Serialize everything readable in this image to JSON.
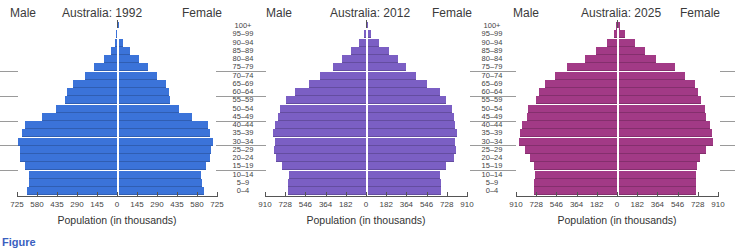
{
  "age_groups": [
    "0–4",
    "5–9",
    "10–14",
    "15–19",
    "20–24",
    "25–29",
    "30–34",
    "35–39",
    "40–44",
    "45–49",
    "50–54",
    "55–59",
    "60–64",
    "65–69",
    "70–74",
    "75–79",
    "80–84",
    "85–89",
    "90–94",
    "95–99",
    "100+"
  ],
  "panels": [
    {
      "title": "Australia: 1992",
      "male_label": "Male",
      "female_label": "Female",
      "color": "#3b73d9",
      "axis_max": 725,
      "ticks": [
        "725",
        "580",
        "435",
        "290",
        "145",
        "0",
        "145",
        "290",
        "435",
        "580",
        "725"
      ],
      "xlabel": "Population (in thousands)"
    },
    {
      "title": "Australia: 2012",
      "male_label": "Male",
      "female_label": "Female",
      "color": "#7b5fc4",
      "axis_max": 910,
      "ticks": [
        "910",
        "728",
        "546",
        "364",
        "182",
        "0",
        "182",
        "364",
        "546",
        "728",
        "910"
      ],
      "xlabel": "Population (in thousands)"
    },
    {
      "title": "Australia: 2025",
      "male_label": "Male",
      "female_label": "Female",
      "color": "#a23a86",
      "axis_max": 910,
      "ticks": [
        "910",
        "728",
        "546",
        "364",
        "182",
        "0",
        "182",
        "364",
        "546",
        "728",
        "910"
      ],
      "xlabel": "Population (in thousands)"
    }
  ],
  "caption": "Figure",
  "chart_data": [
    {
      "type": "bar",
      "orientation": "horizontal",
      "title": "Australia: 1992",
      "xlabel": "Population (in thousands)",
      "ylabel": "Age group",
      "categories": [
        "0–4",
        "5–9",
        "10–14",
        "15–19",
        "20–24",
        "25–29",
        "30–34",
        "35–39",
        "40–44",
        "45–49",
        "50–54",
        "55–59",
        "60–64",
        "65–69",
        "70–74",
        "75–79",
        "80–84",
        "85–89",
        "90–94",
        "95–99",
        "100+"
      ],
      "series": [
        {
          "name": "Male",
          "values": [
            650,
            640,
            635,
            670,
            700,
            705,
            715,
            690,
            670,
            545,
            440,
            380,
            365,
            320,
            235,
            165,
            95,
            45,
            15,
            4,
            0
          ]
        },
        {
          "name": "Female",
          "values": [
            620,
            610,
            600,
            640,
            665,
            675,
            690,
            665,
            650,
            540,
            445,
            375,
            370,
            350,
            285,
            220,
            150,
            85,
            35,
            10,
            1
          ]
        }
      ],
      "xlim": [
        -725,
        725
      ],
      "ticks": [
        725,
        580,
        435,
        290,
        145,
        0,
        145,
        290,
        435,
        580,
        725
      ],
      "color": "#3b73d9",
      "legend": [
        "Male",
        "Female"
      ]
    },
    {
      "type": "bar",
      "orientation": "horizontal",
      "title": "Australia: 2012",
      "xlabel": "Population (in thousands)",
      "ylabel": "Age group",
      "categories": [
        "0–4",
        "5–9",
        "10–14",
        "15–19",
        "20–24",
        "25–29",
        "30–34",
        "35–39",
        "40–44",
        "45–49",
        "50–54",
        "55–59",
        "60–64",
        "65–69",
        "70–74",
        "75–79",
        "80–84",
        "85–89",
        "90–94",
        "95–99",
        "100+"
      ],
      "series": [
        {
          "name": "Male",
          "values": [
            700,
            700,
            695,
            755,
            810,
            830,
            820,
            840,
            820,
            795,
            775,
            720,
            640,
            515,
            410,
            300,
            220,
            135,
            60,
            15,
            2
          ]
        },
        {
          "name": "Female",
          "values": [
            665,
            665,
            660,
            715,
            780,
            800,
            790,
            810,
            795,
            780,
            770,
            715,
            655,
            540,
            440,
            350,
            275,
            195,
            105,
            35,
            5
          ]
        }
      ],
      "xlim": [
        -910,
        910
      ],
      "ticks": [
        910,
        728,
        546,
        364,
        182,
        0,
        182,
        364,
        546,
        728,
        910
      ],
      "color": "#7b5fc4",
      "legend": [
        "Male",
        "Female"
      ]
    },
    {
      "type": "bar",
      "orientation": "horizontal",
      "title": "Australia: 2025",
      "xlabel": "Population (in thousands)",
      "ylabel": "Age group",
      "categories": [
        "0–4",
        "5–9",
        "10–14",
        "15–19",
        "20–24",
        "25–29",
        "30–34",
        "35–39",
        "40–44",
        "45–49",
        "50–54",
        "55–59",
        "60–64",
        "65–69",
        "70–74",
        "75–79",
        "80–84",
        "85–89",
        "90–94",
        "95–99",
        "100+"
      ],
      "series": [
        {
          "name": "Male",
          "values": [
            745,
            745,
            740,
            750,
            780,
            830,
            880,
            870,
            860,
            810,
            800,
            730,
            700,
            650,
            560,
            450,
            285,
            185,
            90,
            30,
            12
          ]
        },
        {
          "name": "Female",
          "values": [
            705,
            705,
            705,
            710,
            740,
            795,
            860,
            845,
            830,
            790,
            780,
            750,
            720,
            690,
            600,
            510,
            345,
            240,
            150,
            65,
            20
          ]
        }
      ],
      "xlim": [
        -910,
        910
      ],
      "ticks": [
        910,
        728,
        546,
        364,
        182,
        0,
        182,
        364,
        546,
        728,
        910
      ],
      "color": "#a23a86",
      "legend": [
        "Male",
        "Female"
      ]
    }
  ]
}
